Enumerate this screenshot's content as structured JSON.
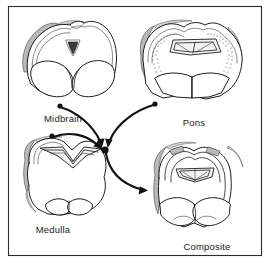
{
  "figure": {
    "background_color": "#ffffff",
    "ink_color": "#1c1c1c",
    "shade_color": "#b9b9b9",
    "frame": {
      "name": "figure-border",
      "x": 8,
      "y": 6,
      "width": 254,
      "height": 250
    }
  },
  "sections": [
    {
      "id": "midbrain",
      "label": "Midbrain",
      "label_x": 63,
      "label_y": 122,
      "center_x": 72,
      "center_y": 62
    },
    {
      "id": "pons",
      "label": "Pons",
      "label_x": 194,
      "label_y": 126,
      "center_x": 192,
      "center_y": 65
    },
    {
      "id": "medulla",
      "label": "Medulla",
      "label_x": 53,
      "label_y": 233,
      "center_x": 67,
      "center_y": 185
    },
    {
      "id": "composite",
      "label": "Composite",
      "label_x": 207,
      "label_y": 250,
      "center_x": 200,
      "center_y": 195
    }
  ],
  "flow": {
    "hub": {
      "x": 105,
      "y": 150,
      "radius": 3.6
    },
    "arrows": [
      {
        "id": "midbrain-to-hub",
        "from": "midbrain",
        "to": "hub",
        "source_dot": {
          "x": 60,
          "y": 106,
          "radius": 2.6
        },
        "has_arrowhead": true
      },
      {
        "id": "pons-to-hub",
        "from": "pons",
        "to": "hub",
        "source_dot": {
          "x": 155,
          "y": 104,
          "radius": 2.6
        },
        "has_arrowhead": true
      },
      {
        "id": "medulla-to-hub",
        "from": "medulla",
        "to": "hub",
        "source_dot": {
          "x": 52,
          "y": 136,
          "radius": 2.6
        },
        "has_arrowhead": true
      },
      {
        "id": "hub-to-composite",
        "from": "hub",
        "to": "composite",
        "source_dot": null,
        "has_arrowhead": true
      }
    ]
  }
}
